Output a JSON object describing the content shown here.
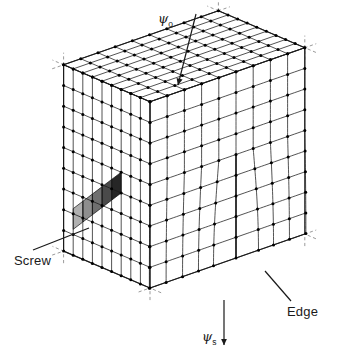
{
  "figure": {
    "name": "cube-lattice-dislocation-diagram",
    "type": "diagram",
    "background_color": "#ffffff",
    "line_color": "#1a1a1a",
    "node_color": "#000000",
    "dashed_axis_color": "#9a9a9a",
    "width": 341,
    "height": 357
  },
  "labels": {
    "screw": "Screw",
    "edge": "Edge",
    "psi_o_symbol": "ψ",
    "psi_o_subscript": "o",
    "psi_s_symbol": "ψ",
    "psi_s_subscript": "s"
  },
  "geometry": {
    "cube_divisions": 9,
    "projection": "axonometric",
    "origin": {
      "x": 150,
      "y": 288
    },
    "axis_x": {
      "dx": 17.2,
      "dy": -6.0
    },
    "axis_y": {
      "dx": -9.6,
      "dy": -4.1
    },
    "axis_z": {
      "dx": 0.0,
      "dy": -20.7
    },
    "corner_axis_marks": 4,
    "corner_axis_mark_length": 22
  },
  "features": {
    "screw_dislocation": {
      "name": "screw-dislocation-band",
      "face": "left",
      "cell_count": 5,
      "shade_colors": [
        "#262626",
        "#4a4a4a",
        "#6f6f6f",
        "#8e8e8e",
        "#b0b0b0"
      ]
    },
    "edge_dislocation": {
      "name": "edge-dislocation-half-plane",
      "face": "right",
      "terminates_at_row": 4
    }
  },
  "arrows": {
    "psi_o": {
      "name": "psi-o-load-arrow",
      "x1": 196,
      "y1": 14,
      "x2": 178,
      "y2": 85,
      "direction": "down-left"
    },
    "psi_s": {
      "name": "psi-s-load-arrow",
      "x1": 224,
      "y1": 300,
      "x2": 224,
      "y2": 345,
      "direction": "down"
    },
    "screw_leader": {
      "name": "screw-leader-line",
      "x1": 33,
      "y1": 250,
      "x2": 89,
      "y2": 228
    },
    "edge_leader": {
      "name": "edge-leader-line",
      "x1": 291,
      "y1": 301,
      "x2": 265,
      "y2": 271
    }
  },
  "chart_data": {
    "type": "diagram",
    "title": "",
    "annotations": [
      {
        "text": "ψo",
        "role": "applied-normal-load",
        "position": "top"
      },
      {
        "text": "ψs",
        "role": "applied-shear-load",
        "position": "bottom"
      },
      {
        "text": "Screw",
        "role": "feature-callout",
        "position": "bottom-left"
      },
      {
        "text": "Edge",
        "role": "feature-callout",
        "position": "bottom-right"
      }
    ]
  }
}
